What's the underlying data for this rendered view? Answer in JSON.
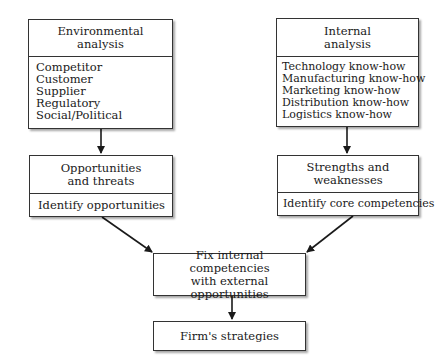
{
  "diagram": {
    "environmental": {
      "title_lines": [
        "Environmental",
        "analysis"
      ],
      "items": [
        "Competitor",
        "Customer",
        "Supplier",
        "Regulatory",
        "Social/Political"
      ]
    },
    "internal": {
      "title_lines": [
        "Internal",
        "analysis"
      ],
      "items": [
        "Technology know-how",
        "Manufacturing know-how",
        "Marketing know-how",
        "Distribution know-how",
        "Logistics know-how"
      ]
    },
    "opportunities": {
      "title_lines": [
        "Opportunities",
        "and threats"
      ],
      "items": [
        "Identify opportunities"
      ]
    },
    "strengths": {
      "title_lines": [
        "Strengths and",
        "weaknesses"
      ],
      "items": [
        "Identify core competencies"
      ]
    },
    "fit": {
      "lines": [
        "Fix internal competencies",
        "with external opportunities"
      ]
    },
    "strategies": {
      "label": "Firm's strategies"
    },
    "colors": {
      "line": "#1a1a1a",
      "box_border": "#333333",
      "background": "#ffffff"
    }
  }
}
